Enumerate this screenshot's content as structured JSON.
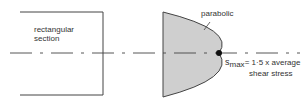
{
  "diagram": {
    "labels": {
      "rect_line1": "rectangular",
      "rect_line2": "section",
      "parabolic": "parabolic",
      "smax_symbol": "s",
      "smax_sub": "max",
      "smax_eq": "= 1·5 x average",
      "smax_line2": "shear stress"
    },
    "colors": {
      "line": "#444444",
      "fill": "#cfcfcf",
      "point": "#111111"
    }
  }
}
